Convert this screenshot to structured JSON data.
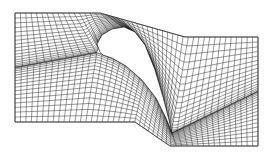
{
  "figure": {
    "width": 269,
    "height": 155,
    "background": "#ffffff",
    "line_color": "#1a1a1a"
  },
  "domain_boundary": {
    "inlet": {
      "x": 15,
      "y_top": 13,
      "y_bottom": 122
    },
    "outlet": {
      "x": 258,
      "y_top": 37,
      "y_bottom": 146
    },
    "top_left_edge": {
      "x_start": 15,
      "x_end": 100,
      "y": 13
    },
    "top_right_edge": {
      "x_start": 185,
      "x_end": 258,
      "y": 37
    },
    "bottom_left_edge": {
      "x_start": 15,
      "x_end": 135,
      "y": 122
    },
    "bottom_right_edge": {
      "x_start": 170,
      "x_end": 258,
      "y": 146
    }
  },
  "blade": {
    "leading_edge": [
      100,
      52
    ],
    "suction_peak": [
      120,
      28
    ],
    "trailing_edge": [
      172,
      133
    ],
    "suction_side": [
      [
        100,
        52
      ],
      [
        97,
        44
      ],
      [
        102,
        35
      ],
      [
        112,
        29
      ],
      [
        124,
        27
      ],
      [
        135,
        32
      ],
      [
        145,
        45
      ],
      [
        155,
        70
      ],
      [
        163,
        97
      ],
      [
        169,
        120
      ],
      [
        172,
        133
      ]
    ],
    "pressure_side": [
      [
        172,
        133
      ],
      [
        166,
        118
      ],
      [
        156,
        98
      ],
      [
        142,
        80
      ],
      [
        126,
        66
      ],
      [
        112,
        58
      ],
      [
        103,
        55
      ],
      [
        100,
        52
      ]
    ]
  },
  "mesh": {
    "streamwise_lines": 46,
    "pitchwise_lines": 34
  }
}
